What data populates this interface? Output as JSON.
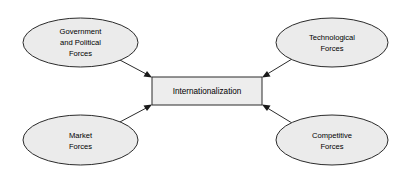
{
  "diagram": {
    "type": "convergent-forces",
    "background_color": "#ffffff",
    "shape_fill_color": "#ebebeb",
    "center_fill_color": "#ededed",
    "stroke_color": "#2b2b2b",
    "center": {
      "label": "Internationalization",
      "shape": "rectangle"
    },
    "nodes": [
      {
        "id": "government-and-political-forces",
        "shape": "ellipse",
        "position": "top-left",
        "lines": [
          "Government",
          "and Political",
          "Forces"
        ]
      },
      {
        "id": "technological-forces",
        "shape": "ellipse",
        "position": "top-right",
        "lines": [
          "Technological",
          "Forces"
        ]
      },
      {
        "id": "market-forces",
        "shape": "ellipse",
        "position": "bottom-left",
        "lines": [
          "Market",
          "Forces"
        ]
      },
      {
        "id": "competitive-forces",
        "shape": "ellipse",
        "position": "bottom-right",
        "lines": [
          "Competitive",
          "Forces"
        ]
      }
    ],
    "connectors": [
      {
        "id": "arrow-government-to-center",
        "from": "government-and-political-forces",
        "to": "center",
        "direction": "to-center"
      },
      {
        "id": "arrow-technological-to-center",
        "from": "technological-forces",
        "to": "center",
        "direction": "to-center"
      },
      {
        "id": "arrow-market-to-center",
        "from": "market-forces",
        "to": "center",
        "direction": "to-center"
      },
      {
        "id": "arrow-competitive-to-center",
        "from": "competitive-forces",
        "to": "center",
        "direction": "to-center"
      }
    ]
  }
}
